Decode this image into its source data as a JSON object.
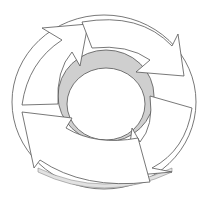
{
  "diagram": {
    "type": "cycle",
    "segments": 4,
    "direction": "clockwise",
    "colors": {
      "background": "#ffffff",
      "arrow_fill": "#ffffff",
      "stroke": "#555555",
      "inner_wall": "#cfcfcf",
      "shadow": "#e2e2e2"
    },
    "labels": []
  }
}
